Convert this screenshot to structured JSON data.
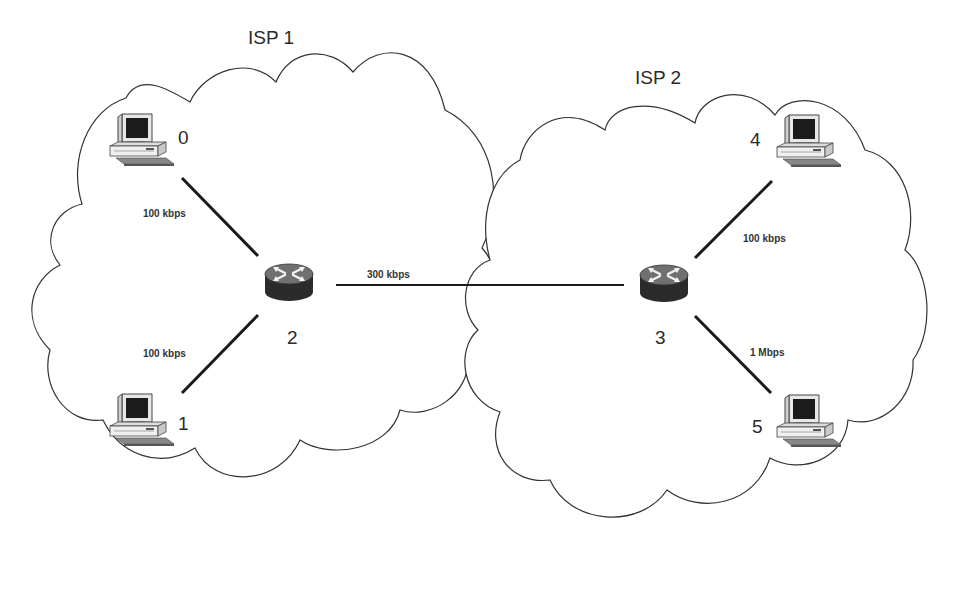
{
  "diagram": {
    "clouds": [
      {
        "id": "isp1",
        "label": "ISP 1"
      },
      {
        "id": "isp2",
        "label": "ISP 2"
      }
    ],
    "nodes": [
      {
        "id": "0",
        "label": "0",
        "type": "host",
        "cloud": "isp1"
      },
      {
        "id": "1",
        "label": "1",
        "type": "host",
        "cloud": "isp1"
      },
      {
        "id": "2",
        "label": "2",
        "type": "router",
        "cloud": "isp1"
      },
      {
        "id": "3",
        "label": "3",
        "type": "router",
        "cloud": "isp2"
      },
      {
        "id": "4",
        "label": "4",
        "type": "host",
        "cloud": "isp2"
      },
      {
        "id": "5",
        "label": "5",
        "type": "host",
        "cloud": "isp2"
      }
    ],
    "links": [
      {
        "from": "0",
        "to": "2",
        "label": "100 kbps"
      },
      {
        "from": "1",
        "to": "2",
        "label": "100 kbps"
      },
      {
        "from": "2",
        "to": "3",
        "label": "300 kbps"
      },
      {
        "from": "3",
        "to": "4",
        "label": "100 kbps"
      },
      {
        "from": "3",
        "to": "5",
        "label": "1 Mbps"
      }
    ],
    "icons": {
      "host": "desktop-computer-icon",
      "router": "router-icon"
    },
    "colors": {
      "line": "#1a1a1a",
      "cloud_stroke": "#333333",
      "router_body": "#2b2b2b",
      "router_top": "#6e6e6e",
      "screen": "#1c1c1c"
    }
  }
}
